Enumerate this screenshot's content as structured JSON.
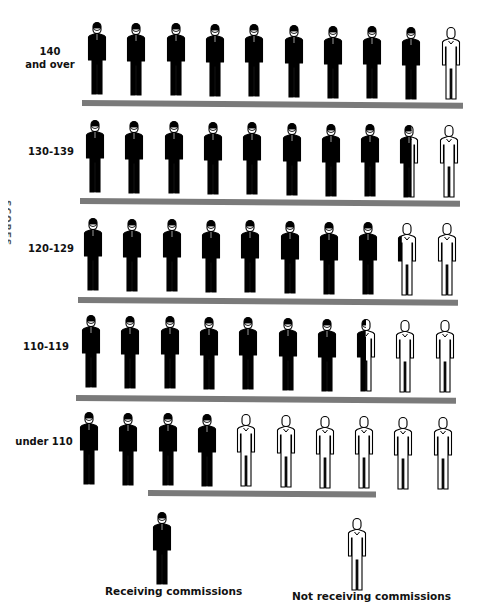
{
  "chart_data": {
    "type": "pictograph",
    "title": "",
    "ylabel": "(partially cropped vertical axis label)",
    "xlabel": "",
    "unit_note": "Each row of 10 figures = 100%; filled portion = share receiving commissions",
    "categories": [
      "140 and over",
      "130-139",
      "120-129",
      "110-119",
      "under 110"
    ],
    "series": [
      {
        "name": "Receiving commissions",
        "values": [
          9.1,
          8.6,
          8.3,
          7.5,
          4.0
        ],
        "color": "#000000"
      },
      {
        "name": "Not receiving commissions",
        "values": [
          0.9,
          1.4,
          1.7,
          2.5,
          6.0
        ],
        "color": "#ffffff"
      }
    ],
    "figures_per_row": 10,
    "legend": [
      "Receiving commissions",
      "Not receiving commissions"
    ],
    "legend_position": "bottom",
    "grid": false
  },
  "axis": {
    "label": "SCORES"
  },
  "rows": [
    {
      "label_line1": "140",
      "label_line2": "and over",
      "filled": 9.1
    },
    {
      "label_line1": "130-139",
      "label_line2": "",
      "filled": 8.6
    },
    {
      "label_line1": "120-129",
      "label_line2": "",
      "filled": 8.3
    },
    {
      "label_line1": "110-119",
      "label_line2": "",
      "filled": 7.5
    },
    {
      "label_line1": "under 110",
      "label_line2": "",
      "filled": 4.0
    }
  ],
  "legend": {
    "receiving": "Receiving commissions",
    "not_receiving": "Not receiving commissions"
  },
  "colors": {
    "filled": "#000000",
    "bar": "#7a7a7a",
    "outline": "#000000"
  }
}
